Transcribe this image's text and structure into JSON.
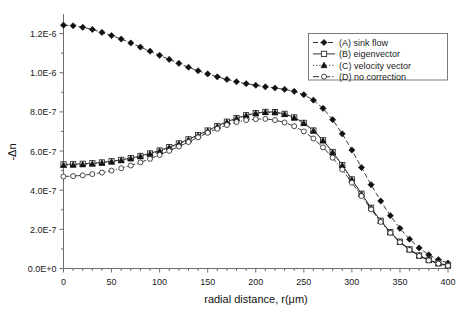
{
  "chart_data": {
    "type": "line",
    "title": "",
    "xlabel": "radial distance, r(μm)",
    "ylabel": "-Δn",
    "xlim": [
      0,
      400
    ],
    "ylim": [
      0,
      1.3e-06
    ],
    "grid": false,
    "legend_position": "top-right",
    "x_ticks": [
      0,
      50,
      100,
      150,
      200,
      250,
      300,
      350,
      400
    ],
    "x_tick_labels": [
      "0",
      "50",
      "100",
      "150",
      "200",
      "250",
      "300",
      "350",
      "400"
    ],
    "y_ticks": [
      0,
      2e-07,
      4e-07,
      6e-07,
      8e-07,
      1e-06,
      1.2e-06
    ],
    "y_tick_labels": [
      "0.0E+0",
      "2.0E-7",
      "4.0E-7",
      "6.0E-7",
      "8.0E-7",
      "1.0E-6",
      "1.2E-6"
    ],
    "x": [
      0,
      10,
      20,
      30,
      40,
      50,
      60,
      70,
      80,
      90,
      100,
      110,
      120,
      130,
      140,
      150,
      160,
      170,
      180,
      190,
      200,
      210,
      220,
      230,
      240,
      250,
      260,
      270,
      280,
      290,
      300,
      310,
      320,
      330,
      340,
      350,
      360,
      370,
      380,
      390,
      400
    ],
    "series": [
      {
        "name": "(A) sink flow",
        "marker": "filled-diamond",
        "line_style": "dashed",
        "color": "#111111",
        "values": [
          1.243e-06,
          1.24e-06,
          1.232e-06,
          1.221e-06,
          1.206e-06,
          1.19e-06,
          1.172e-06,
          1.152e-06,
          1.131e-06,
          1.11e-06,
          1.089e-06,
          1.068e-06,
          1.048e-06,
          1.028e-06,
          1.01e-06,
          9.94e-07,
          9.79e-07,
          9.66e-07,
          9.54e-07,
          9.44e-07,
          9.36e-07,
          9.28e-07,
          9.22e-07,
          9.15e-07,
          9.05e-07,
          8.88e-07,
          8.6e-07,
          8.18e-07,
          7.6e-07,
          6.88e-07,
          6.05e-07,
          5.16e-07,
          4.28e-07,
          3.45e-07,
          2.7e-07,
          2.05e-07,
          1.5e-07,
          1.05e-07,
          7e-08,
          4.5e-08,
          2.8e-08
        ]
      },
      {
        "name": "(B) eigenvector",
        "marker": "open-square",
        "line_style": "solid",
        "color": "#222222",
        "values": [
          5.32e-07,
          5.33e-07,
          5.35e-07,
          5.38e-07,
          5.42e-07,
          5.48e-07,
          5.55e-07,
          5.64e-07,
          5.75e-07,
          5.88e-07,
          6.03e-07,
          6.2e-07,
          6.39e-07,
          6.6e-07,
          6.82e-07,
          7.05e-07,
          7.28e-07,
          7.5e-07,
          7.68e-07,
          7.83e-07,
          7.94e-07,
          8e-07,
          7.99e-07,
          7.9e-07,
          7.72e-07,
          7.44e-07,
          7.05e-07,
          6.55e-07,
          5.95e-07,
          5.28e-07,
          4.55e-07,
          3.82e-07,
          3.1e-07,
          2.44e-07,
          1.86e-07,
          1.37e-07,
          9.8e-08,
          6.7e-08,
          4.4e-08,
          2.7e-08,
          1.6e-08
        ]
      },
      {
        "name": "(C) velocity vector",
        "marker": "filled-triangle",
        "line_style": "dotted",
        "color": "#111111",
        "values": [
          5.28e-07,
          5.29e-07,
          5.31e-07,
          5.34e-07,
          5.39e-07,
          5.45e-07,
          5.52e-07,
          5.61e-07,
          5.72e-07,
          5.85e-07,
          6e-07,
          6.17e-07,
          6.36e-07,
          6.57e-07,
          6.79e-07,
          7.02e-07,
          7.25e-07,
          7.47e-07,
          7.66e-07,
          7.81e-07,
          7.92e-07,
          7.98e-07,
          7.97e-07,
          7.88e-07,
          7.7e-07,
          7.42e-07,
          7.03e-07,
          6.53e-07,
          5.93e-07,
          5.26e-07,
          4.53e-07,
          3.8e-07,
          3.08e-07,
          2.42e-07,
          1.84e-07,
          1.35e-07,
          9.6e-08,
          6.5e-08,
          4.2e-08,
          2.6e-08,
          1.5e-08
        ]
      },
      {
        "name": "(D) no correction",
        "marker": "open-circle",
        "line_style": "dash-dot",
        "color": "#555555",
        "values": [
          4.7e-07,
          4.72e-07,
          4.76e-07,
          4.82e-07,
          4.9e-07,
          5e-07,
          5.12e-07,
          5.26e-07,
          5.42e-07,
          5.6e-07,
          5.8e-07,
          6.01e-07,
          6.23e-07,
          6.46e-07,
          6.7e-07,
          6.93e-07,
          7.14e-07,
          7.33e-07,
          7.48e-07,
          7.58e-07,
          7.63e-07,
          7.64e-07,
          7.58e-07,
          7.46e-07,
          7.27e-07,
          7e-07,
          6.64e-07,
          6.19e-07,
          5.66e-07,
          5.05e-07,
          4.38e-07,
          3.7e-07,
          3.02e-07,
          2.38e-07,
          1.82e-07,
          1.34e-07,
          9.5e-08,
          6.4e-08,
          4.1e-08,
          2.5e-08,
          1.4e-08
        ]
      }
    ]
  },
  "legend": {
    "entries": [
      {
        "label": "(A) sink flow"
      },
      {
        "label": "(B) eigenvector"
      },
      {
        "label": "(C) velocity vector"
      },
      {
        "label": "(D) no correction"
      }
    ]
  }
}
